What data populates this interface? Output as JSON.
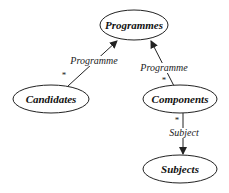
{
  "diagram": {
    "type": "entity-relationship",
    "colors": {
      "stroke": "#222222",
      "fill": "#ffffff",
      "text": "#111111"
    },
    "nodes": [
      {
        "id": "programmes",
        "label": "Programmes",
        "cx": 134,
        "cy": 25,
        "rx": 34,
        "ry": 15
      },
      {
        "id": "candidates",
        "label": "Candidates",
        "cx": 51,
        "cy": 99,
        "rx": 38,
        "ry": 14
      },
      {
        "id": "components",
        "label": "Components",
        "cx": 180,
        "cy": 99,
        "rx": 37,
        "ry": 14
      },
      {
        "id": "subjects",
        "label": "Subjects",
        "cx": 180,
        "cy": 169,
        "rx": 37,
        "ry": 14
      }
    ],
    "edges": [
      {
        "from": "candidates",
        "to": "programmes",
        "label": "Programme",
        "multiplicity": "*"
      },
      {
        "from": "components",
        "to": "programmes",
        "label": "Programme",
        "multiplicity": "*"
      },
      {
        "from": "components",
        "to": "subjects",
        "label": "Subject",
        "multiplicity": "*"
      }
    ]
  }
}
